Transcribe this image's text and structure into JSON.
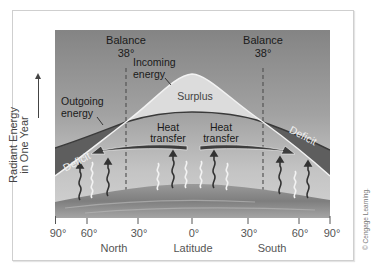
{
  "diagram": {
    "y_axis_label_line1": "Radiant Energy",
    "y_axis_label_line2": "in One Year",
    "x_axis_ticks": [
      "90°",
      "60°",
      "30°",
      "0°",
      "30°",
      "60°",
      "90°"
    ],
    "x_axis_groups": {
      "north": "North",
      "center": "Latitude",
      "south": "South"
    },
    "balance_left": {
      "label": "Balance",
      "value": "38°"
    },
    "balance_right": {
      "label": "Balance",
      "value": "38°"
    },
    "labels": {
      "incoming_line1": "Incoming",
      "incoming_line2": "energy",
      "outgoing_line1": "Outgoing",
      "outgoing_line2": "energy",
      "surplus": "Surplus",
      "deficit_left": "Deficit",
      "deficit_right": "Deficit",
      "heat_left_line1": "Heat",
      "heat_left_line2": "transfer",
      "heat_right_line1": "Heat",
      "heat_right_line2": "transfer"
    },
    "colors": {
      "sky_top": "#858585",
      "sky_bottom": "#c9c9c9",
      "surplus_fill": "#dcdcdc",
      "deficit_fill": "#5c5c5c",
      "outgoing_line": "#3a3a3a",
      "incoming_line": "#f2f2f2",
      "earth": "#8a8a8a",
      "arrow_dark": "#333333",
      "arrow_light": "#f0f0f0"
    },
    "copyright": "© Cengage Learning."
  }
}
